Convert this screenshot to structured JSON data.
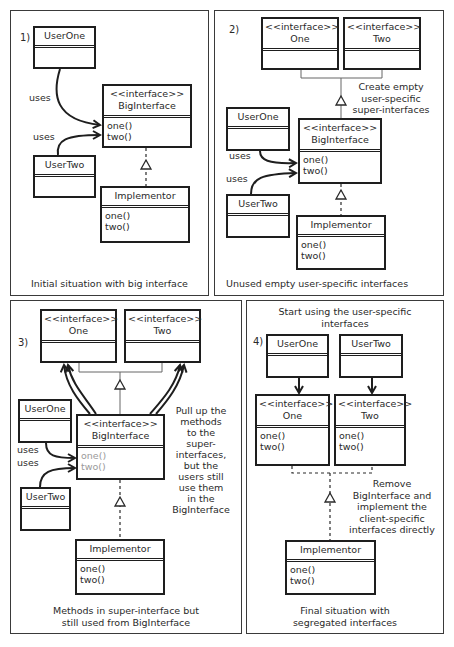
{
  "panels": [
    {
      "stage": "1)",
      "caption": "Initial situation with big interface",
      "classes": {
        "user_one": {
          "name": "UserOne",
          "methods": []
        },
        "user_two": {
          "name": "UserTwo",
          "methods": []
        },
        "big_interface": {
          "stereotype": "<<interface>>",
          "name": "BigInterface",
          "methods": [
            "one()",
            "two()"
          ]
        },
        "implementor": {
          "name": "Implementor",
          "methods": [
            "one()",
            "two()"
          ]
        }
      },
      "relations": {
        "uses_one": "uses",
        "uses_two": "uses"
      }
    },
    {
      "stage": "2)",
      "caption": "Unused empty user-specific interfaces",
      "note": [
        "Create empty",
        "user-specific",
        "super-interfaces"
      ],
      "classes": {
        "one": {
          "stereotype": "<<interface>>",
          "name": "One",
          "methods": []
        },
        "two": {
          "stereotype": "<<interface>>",
          "name": "Two",
          "methods": []
        },
        "user_one": {
          "name": "UserOne",
          "methods": []
        },
        "user_two": {
          "name": "UserTwo",
          "methods": []
        },
        "big_interface": {
          "stereotype": "<<interface>>",
          "name": "BigInterface",
          "methods": [
            "one()",
            "two()"
          ]
        },
        "implementor": {
          "name": "Implementor",
          "methods": [
            "one()",
            "two()"
          ]
        }
      },
      "relations": {
        "uses_one": "uses",
        "uses_two": "uses"
      }
    },
    {
      "stage": "3)",
      "caption": [
        "Methods in super-interface but",
        "still used from BigInterface"
      ],
      "note": [
        "Pull up the",
        "methods",
        "to the",
        "super-",
        "interfaces,",
        "but the",
        "users still",
        "use them",
        "in the",
        "BigInterface"
      ],
      "classes": {
        "one": {
          "stereotype": "<<interface>>",
          "name": "One",
          "methods": []
        },
        "two": {
          "stereotype": "<<interface>>",
          "name": "Two",
          "methods": []
        },
        "user_one": {
          "name": "UserOne",
          "methods": []
        },
        "user_two": {
          "name": "UserTwo",
          "methods": []
        },
        "big_interface": {
          "stereotype": "<<interface>>",
          "name": "BigInterface",
          "methods": [
            "one()",
            "two()"
          ]
        },
        "implementor": {
          "name": "Implementor",
          "methods": [
            "one()",
            "two()"
          ]
        }
      },
      "relations": {
        "uses_one": "uses",
        "uses_two": "uses"
      }
    },
    {
      "stage": "4)",
      "title": [
        "Start using the user-specific",
        "interfaces"
      ],
      "caption": [
        "Final situation with",
        "segregated interfaces"
      ],
      "note": [
        "Remove",
        "BigInterface and",
        "implement the",
        "client-specific",
        "interfaces directly"
      ],
      "classes": {
        "user_one": {
          "name": "UserOne",
          "methods": []
        },
        "user_two": {
          "name": "UserTwo",
          "methods": []
        },
        "one": {
          "stereotype": "<<interface>>",
          "name": "One",
          "methods": [
            "one()",
            "two()"
          ]
        },
        "two": {
          "stereotype": "<<interface>>",
          "name": "Two",
          "methods": [
            "one()",
            "two()"
          ]
        },
        "implementor": {
          "name": "Implementor",
          "methods": [
            "one()",
            "two()"
          ]
        }
      }
    }
  ]
}
